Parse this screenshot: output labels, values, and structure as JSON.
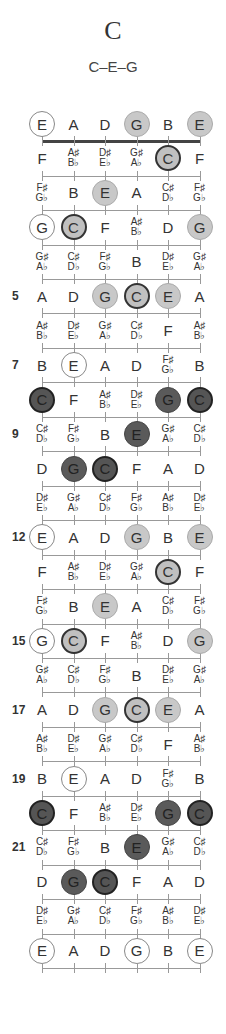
{
  "chord": {
    "name": "C",
    "notes": "C–E–G"
  },
  "strings": [
    "E",
    "A",
    "D",
    "G",
    "B",
    "E"
  ],
  "fret_numbers": [
    {
      "fret": 5,
      "label": "5"
    },
    {
      "fret": 7,
      "label": "7"
    },
    {
      "fret": 9,
      "label": "9"
    },
    {
      "fret": 12,
      "label": "12"
    },
    {
      "fret": 15,
      "label": "15"
    },
    {
      "fret": 17,
      "label": "17"
    },
    {
      "fret": 19,
      "label": "19"
    },
    {
      "fret": 21,
      "label": "21"
    }
  ],
  "legend": {
    "open": "open/unused chord tone (white circle)",
    "light": "chord tone (light grey)",
    "lightroot": "root C (light grey, bold outline)",
    "dark": "chord tone (dark)",
    "darkroot": "root C (dark, bold outline)"
  },
  "rows": [
    {
      "fret": 0,
      "cells": [
        [
          "E",
          "open"
        ],
        [
          "A",
          ""
        ],
        [
          "D",
          ""
        ],
        [
          "G",
          "light"
        ],
        [
          "B",
          ""
        ],
        [
          "E",
          "light"
        ]
      ]
    },
    {
      "fret": 1,
      "cells": [
        [
          "F",
          ""
        ],
        [
          "A♯|B♭",
          ""
        ],
        [
          "D♯|E♭",
          ""
        ],
        [
          "G♯|A♭",
          ""
        ],
        [
          "C",
          "lightroot"
        ],
        [
          "F",
          ""
        ]
      ]
    },
    {
      "fret": 2,
      "cells": [
        [
          "F♯|G♭",
          ""
        ],
        [
          "B",
          ""
        ],
        [
          "E",
          "light"
        ],
        [
          "A",
          ""
        ],
        [
          "C♯|D♭",
          ""
        ],
        [
          "F♯|G♭",
          ""
        ]
      ]
    },
    {
      "fret": 3,
      "cells": [
        [
          "G",
          "open"
        ],
        [
          "C",
          "lightroot"
        ],
        [
          "F",
          ""
        ],
        [
          "A♯|B♭",
          ""
        ],
        [
          "D",
          ""
        ],
        [
          "G",
          "light"
        ]
      ]
    },
    {
      "fret": 4,
      "cells": [
        [
          "G♯|A♭",
          ""
        ],
        [
          "C♯|D♭",
          ""
        ],
        [
          "F♯|G♭",
          ""
        ],
        [
          "B",
          ""
        ],
        [
          "D♯|E♭",
          ""
        ],
        [
          "G♯|A♭",
          ""
        ]
      ]
    },
    {
      "fret": 5,
      "cells": [
        [
          "A",
          ""
        ],
        [
          "D",
          ""
        ],
        [
          "G",
          "light"
        ],
        [
          "C",
          "lightroot"
        ],
        [
          "E",
          "light"
        ],
        [
          "A",
          ""
        ]
      ]
    },
    {
      "fret": 6,
      "cells": [
        [
          "A♯|B♭",
          ""
        ],
        [
          "D♯|E♭",
          ""
        ],
        [
          "G♯|A♭",
          ""
        ],
        [
          "C♯|D♭",
          ""
        ],
        [
          "F",
          ""
        ],
        [
          "A♯|B♭",
          ""
        ]
      ]
    },
    {
      "fret": 7,
      "cells": [
        [
          "B",
          ""
        ],
        [
          "E",
          "open"
        ],
        [
          "A",
          ""
        ],
        [
          "D",
          ""
        ],
        [
          "F♯|G♭",
          ""
        ],
        [
          "B",
          ""
        ]
      ]
    },
    {
      "fret": 8,
      "cells": [
        [
          "C",
          "darkroot"
        ],
        [
          "F",
          ""
        ],
        [
          "A♯|B♭",
          ""
        ],
        [
          "D♯|E♭",
          ""
        ],
        [
          "G",
          "dark"
        ],
        [
          "C",
          "darkroot"
        ]
      ]
    },
    {
      "fret": 9,
      "cells": [
        [
          "C♯|D♭",
          ""
        ],
        [
          "F♯|G♭",
          ""
        ],
        [
          "B",
          ""
        ],
        [
          "E",
          "dark"
        ],
        [
          "G♯|A♭",
          ""
        ],
        [
          "C♯|D♭",
          ""
        ]
      ]
    },
    {
      "fret": 10,
      "cells": [
        [
          "D",
          ""
        ],
        [
          "G",
          "dark"
        ],
        [
          "C",
          "darkroot"
        ],
        [
          "F",
          ""
        ],
        [
          "A",
          ""
        ],
        [
          "D",
          ""
        ]
      ]
    },
    {
      "fret": 11,
      "cells": [
        [
          "D♯|E♭",
          ""
        ],
        [
          "G♯|A♭",
          ""
        ],
        [
          "C♯|D♭",
          ""
        ],
        [
          "F♯|G♭",
          ""
        ],
        [
          "A♯|B♭",
          ""
        ],
        [
          "D♯|E♭",
          ""
        ]
      ]
    },
    {
      "fret": 12,
      "cells": [
        [
          "E",
          "open"
        ],
        [
          "A",
          ""
        ],
        [
          "D",
          ""
        ],
        [
          "G",
          "light"
        ],
        [
          "B",
          ""
        ],
        [
          "E",
          "light"
        ]
      ]
    },
    {
      "fret": 13,
      "cells": [
        [
          "F",
          ""
        ],
        [
          "A♯|B♭",
          ""
        ],
        [
          "D♯|E♭",
          ""
        ],
        [
          "G♯|A♭",
          ""
        ],
        [
          "C",
          "lightroot"
        ],
        [
          "F",
          ""
        ]
      ]
    },
    {
      "fret": 14,
      "cells": [
        [
          "F♯|G♭",
          ""
        ],
        [
          "B",
          ""
        ],
        [
          "E",
          "light"
        ],
        [
          "A",
          ""
        ],
        [
          "C♯|D♭",
          ""
        ],
        [
          "F♯|G♭",
          ""
        ]
      ]
    },
    {
      "fret": 15,
      "cells": [
        [
          "G",
          "open"
        ],
        [
          "C",
          "lightroot"
        ],
        [
          "F",
          ""
        ],
        [
          "A♯|B♭",
          ""
        ],
        [
          "D",
          ""
        ],
        [
          "G",
          "light"
        ]
      ]
    },
    {
      "fret": 16,
      "cells": [
        [
          "G♯|A♭",
          ""
        ],
        [
          "C♯|D♭",
          ""
        ],
        [
          "F♯|G♭",
          ""
        ],
        [
          "B",
          ""
        ],
        [
          "D♯|E♭",
          ""
        ],
        [
          "G♯|A♭",
          ""
        ]
      ]
    },
    {
      "fret": 17,
      "cells": [
        [
          "A",
          ""
        ],
        [
          "D",
          ""
        ],
        [
          "G",
          "light"
        ],
        [
          "C",
          "lightroot"
        ],
        [
          "E",
          "light"
        ],
        [
          "A",
          ""
        ]
      ]
    },
    {
      "fret": 18,
      "cells": [
        [
          "A♯|B♭",
          ""
        ],
        [
          "D♯|E♭",
          ""
        ],
        [
          "G♯|A♭",
          ""
        ],
        [
          "C♯|D♭",
          ""
        ],
        [
          "F",
          ""
        ],
        [
          "A♯|B♭",
          ""
        ]
      ]
    },
    {
      "fret": 19,
      "cells": [
        [
          "B",
          ""
        ],
        [
          "E",
          "open"
        ],
        [
          "A",
          ""
        ],
        [
          "D",
          ""
        ],
        [
          "F♯|G♭",
          ""
        ],
        [
          "B",
          ""
        ]
      ]
    },
    {
      "fret": 20,
      "cells": [
        [
          "C",
          "darkroot"
        ],
        [
          "F",
          ""
        ],
        [
          "A♯|B♭",
          ""
        ],
        [
          "D♯|E♭",
          ""
        ],
        [
          "G",
          "dark"
        ],
        [
          "C",
          "darkroot"
        ]
      ]
    },
    {
      "fret": 21,
      "cells": [
        [
          "C♯|D♭",
          ""
        ],
        [
          "F♯|G♭",
          ""
        ],
        [
          "B",
          ""
        ],
        [
          "E",
          "dark"
        ],
        [
          "G♯|A♭",
          ""
        ],
        [
          "C♯|D♭",
          ""
        ]
      ]
    },
    {
      "fret": 22,
      "cells": [
        [
          "D",
          ""
        ],
        [
          "G",
          "dark"
        ],
        [
          "C",
          "darkroot"
        ],
        [
          "F",
          ""
        ],
        [
          "A",
          ""
        ],
        [
          "D",
          ""
        ]
      ]
    },
    {
      "fret": 23,
      "cells": [
        [
          "D♯|E♭",
          ""
        ],
        [
          "G♯|A♭",
          ""
        ],
        [
          "C♯|D♭",
          ""
        ],
        [
          "F♯|G♭",
          ""
        ],
        [
          "A♯|B♭",
          ""
        ],
        [
          "D♯|E♭",
          ""
        ]
      ]
    },
    {
      "fret": 24,
      "cells": [
        [
          "E",
          "open"
        ],
        [
          "A",
          ""
        ],
        [
          "D",
          ""
        ],
        [
          "G",
          "open"
        ],
        [
          "B",
          ""
        ],
        [
          "E",
          "open"
        ]
      ]
    }
  ]
}
